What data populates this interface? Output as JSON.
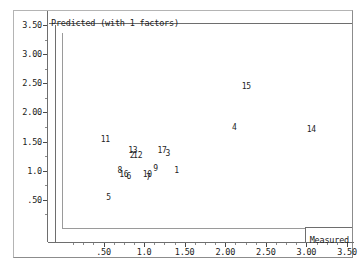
{
  "chart_data": {
    "type": "scatter",
    "title": "Predicted (with 1 factors)",
    "xlabel": "Measured",
    "ylabel": "Predicted (with 1 factors)",
    "xlim": [
      0,
      3.5
    ],
    "ylim": [
      0,
      3.5
    ],
    "grid": false,
    "legend": null,
    "marker_style": "case-number-labels",
    "xticks": [
      {
        "value": 0.5,
        "label": ".50"
      },
      {
        "value": 1.0,
        "label": "1.0"
      },
      {
        "value": 1.5,
        "label": "1.50"
      },
      {
        "value": 2.0,
        "label": "2.00"
      },
      {
        "value": 2.5,
        "label": "2.50"
      },
      {
        "value": 3.0,
        "label": "3.00"
      },
      {
        "value": 3.5,
        "label": "3.50"
      }
    ],
    "yticks": [
      {
        "value": 0.5,
        "label": ".50"
      },
      {
        "value": 1.0,
        "label": "1.0"
      },
      {
        "value": 1.5,
        "label": "1.50"
      },
      {
        "value": 2.0,
        "label": "2.00"
      },
      {
        "value": 2.5,
        "label": "2.50"
      },
      {
        "value": 3.0,
        "label": "3.00"
      },
      {
        "value": 3.5,
        "label": "3.50"
      }
    ],
    "points": [
      {
        "label": "11",
        "x": 0.52,
        "y": 1.53
      },
      {
        "label": "5",
        "x": 0.56,
        "y": 0.53
      },
      {
        "label": "8",
        "x": 0.7,
        "y": 1.0
      },
      {
        "label": "16",
        "x": 0.75,
        "y": 0.93
      },
      {
        "label": "6",
        "x": 0.81,
        "y": 0.89
      },
      {
        "label": "13",
        "x": 0.86,
        "y": 1.33
      },
      {
        "label": "2",
        "x": 0.85,
        "y": 1.25
      },
      {
        "label": "12",
        "x": 0.92,
        "y": 1.26
      },
      {
        "label": "10",
        "x": 1.04,
        "y": 0.92
      },
      {
        "label": "7",
        "x": 1.05,
        "y": 0.87
      },
      {
        "label": "9",
        "x": 1.14,
        "y": 1.03
      },
      {
        "label": "17",
        "x": 1.22,
        "y": 1.34
      },
      {
        "label": "3",
        "x": 1.29,
        "y": 1.29
      },
      {
        "label": "1",
        "x": 1.4,
        "y": 0.99
      },
      {
        "label": "4",
        "x": 2.11,
        "y": 1.74
      },
      {
        "label": "15",
        "x": 2.26,
        "y": 2.44
      },
      {
        "label": "14",
        "x": 3.06,
        "y": 1.69
      }
    ]
  },
  "colors": {
    "frame": "#b4b4b4",
    "axis": "#6e6e6e",
    "plot_border": "#9a9a9a",
    "text": "#1a1a1a",
    "point_label": "#242424",
    "background": "#ffffff"
  }
}
